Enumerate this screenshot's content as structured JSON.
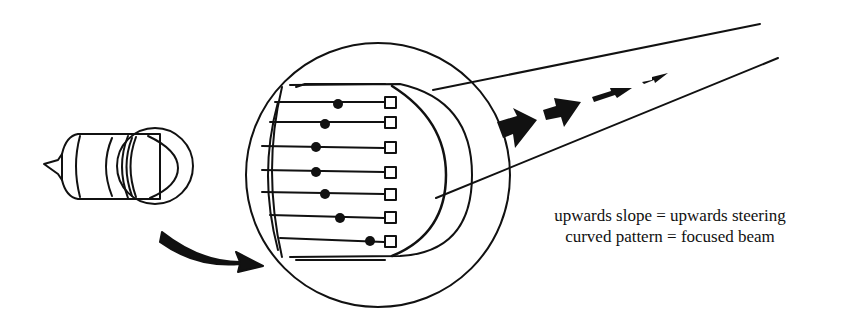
{
  "figure": {
    "captions": [
      "upwards slope = upwards steering",
      "curved pattern = focused beam"
    ],
    "elements": {
      "count": 7,
      "delay_dot_x_offsets": [
        338,
        325,
        316,
        316,
        325,
        338,
        370
      ]
    },
    "beam_arrows": 4,
    "colors": {
      "ink": "#111111",
      "background": "#ffffff"
    }
  }
}
